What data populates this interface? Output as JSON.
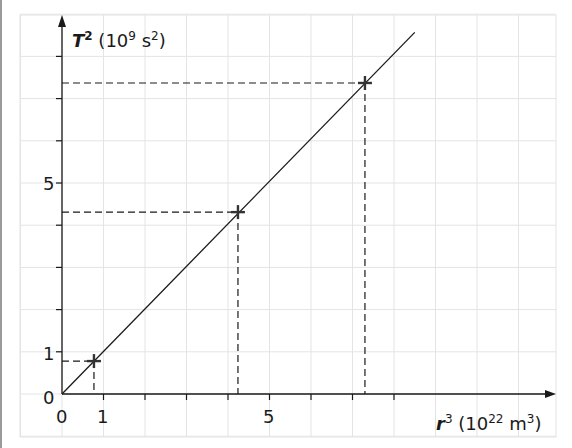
{
  "chart_data": {
    "type": "line",
    "title": "",
    "xlabel": {
      "var": "r",
      "var_exp": "3",
      "unit_pre": "(10",
      "unit_exp": "22",
      "unit_mid": " m",
      "unit_exp2": "3",
      "unit_post": ")"
    },
    "ylabel": {
      "var": "T",
      "var_exp": "2",
      "unit_pre": "(10",
      "unit_exp": "9",
      "unit_mid": " s",
      "unit_exp2": "2",
      "unit_post": ")"
    },
    "xlabel_text": "r^3 (10^22 m^3)",
    "ylabel_text": "T^2 (10^9 s^2)",
    "x_ticks": [
      0,
      1,
      2,
      3,
      4,
      5,
      6,
      7,
      8
    ],
    "x_tick_labels": {
      "0": "0",
      "1": "1",
      "5": "5"
    },
    "y_ticks": [
      0,
      1,
      2,
      3,
      4,
      5,
      6,
      7,
      8
    ],
    "y_tick_labels": {
      "0": "0",
      "1": "1",
      "5": "5"
    },
    "xlim": [
      0,
      11.8
    ],
    "ylim": [
      0,
      8.9
    ],
    "grid": true,
    "legend": null,
    "series": [
      {
        "name": "best-fit line",
        "style": "solid",
        "x": [
          0,
          8.5
        ],
        "y": [
          0,
          8.57
        ]
      },
      {
        "name": "data points",
        "style": "plus-marker",
        "x": [
          0.77,
          4.24,
          7.3
        ],
        "y": [
          0.78,
          4.31,
          7.37
        ],
        "dashed_projections": true
      }
    ]
  },
  "labels": {
    "x_origin": "0",
    "y_origin": "0",
    "x_one": "1",
    "x_five": "5",
    "y_one": "1",
    "y_five": "5",
    "x_var": "r",
    "x_var_exp": "3",
    "x_unit_open": " (10",
    "x_unit_exp": "22",
    "x_unit_m": " m",
    "x_unit_exp2": "3",
    "x_unit_close": ")",
    "y_var": "T",
    "y_var_exp": "2",
    "y_unit_open": " (10",
    "y_unit_exp": "9",
    "y_unit_s": " s",
    "y_unit_exp2": "2",
    "y_unit_close": ")"
  }
}
